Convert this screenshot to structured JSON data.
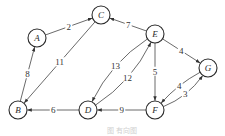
{
  "diagram": {
    "type": "directed-weighted-graph",
    "nodes": [
      {
        "id": "A",
        "label": "A"
      },
      {
        "id": "B",
        "label": "B"
      },
      {
        "id": "C",
        "label": "C"
      },
      {
        "id": "D",
        "label": "D"
      },
      {
        "id": "E",
        "label": "E"
      },
      {
        "id": "F",
        "label": "F"
      },
      {
        "id": "G",
        "label": "G"
      }
    ],
    "edges": [
      {
        "from": "A",
        "to": "C",
        "weight": "2"
      },
      {
        "from": "E",
        "to": "C",
        "weight": "7"
      },
      {
        "from": "C",
        "to": "B",
        "weight": "11"
      },
      {
        "from": "B",
        "to": "A",
        "weight": "8"
      },
      {
        "from": "E",
        "to": "D",
        "weight": "13"
      },
      {
        "from": "D",
        "to": "E",
        "weight": "12"
      },
      {
        "from": "E",
        "to": "F",
        "weight": "5"
      },
      {
        "from": "E",
        "to": "G",
        "weight": "4"
      },
      {
        "from": "G",
        "to": "F",
        "weight": "4"
      },
      {
        "from": "F",
        "to": "G",
        "weight": "3"
      },
      {
        "from": "F",
        "to": "D",
        "weight": "9"
      },
      {
        "from": "D",
        "to": "B",
        "weight": "6"
      }
    ],
    "caption": "图 有向图"
  }
}
